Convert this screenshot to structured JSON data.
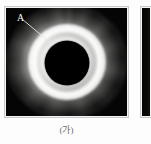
{
  "figure": {
    "caption_a": "(가)",
    "panel_a_label": "A",
    "panel_a_alt": "total-solar-eclipse-corona-photograph",
    "colors": {
      "sky_background": "#050505",
      "corona_bright": "#ffffff",
      "moon_disk": "#000000",
      "frame_border": "#c9c9c7",
      "page_background": "#fdfdfd",
      "caption_text": "#6e6e6e",
      "label_text": "#ffffff"
    }
  },
  "annotations": {
    "leader_line": {
      "label": "A",
      "from_x": 16,
      "from_y": 11,
      "to_x": 47,
      "to_y": 37,
      "stroke": "#e8e8e8"
    }
  },
  "panel_b": {
    "alt": "adjacent-panel-partial"
  }
}
